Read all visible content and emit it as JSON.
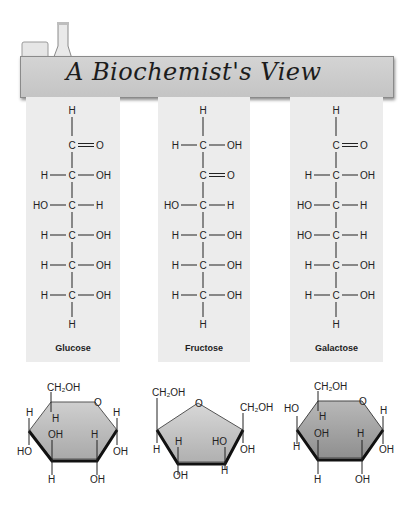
{
  "header": {
    "title": "A Biochemist's View",
    "icon": "lab-glassware-icon"
  },
  "fischer": [
    {
      "name": "Glucose",
      "top": "H",
      "rows": [
        {
          "left": "",
          "center": "C",
          "right": "O",
          "double": true
        },
        {
          "left": "H",
          "center": "C",
          "right": "OH"
        },
        {
          "left": "HO",
          "center": "C",
          "right": "H"
        },
        {
          "left": "H",
          "center": "C",
          "right": "OH"
        },
        {
          "left": "H",
          "center": "C",
          "right": "OH"
        },
        {
          "left": "H",
          "center": "C",
          "right": "OH"
        }
      ],
      "bottom": "H"
    },
    {
      "name": "Fructose",
      "top": "H",
      "rows": [
        {
          "left": "H",
          "center": "C",
          "right": "OH"
        },
        {
          "left": "",
          "center": "C",
          "right": "O",
          "double": true
        },
        {
          "left": "HO",
          "center": "C",
          "right": "H"
        },
        {
          "left": "H",
          "center": "C",
          "right": "OH"
        },
        {
          "left": "H",
          "center": "C",
          "right": "OH"
        },
        {
          "left": "H",
          "center": "C",
          "right": "OH"
        }
      ],
      "bottom": "H"
    },
    {
      "name": "Galactose",
      "top": "H",
      "rows": [
        {
          "left": "",
          "center": "C",
          "right": "O",
          "double": true
        },
        {
          "left": "H",
          "center": "C",
          "right": "OH"
        },
        {
          "left": "HO",
          "center": "C",
          "right": "H"
        },
        {
          "left": "HO",
          "center": "C",
          "right": "H"
        },
        {
          "left": "H",
          "center": "C",
          "right": "OH"
        },
        {
          "left": "H",
          "center": "C",
          "right": "OH"
        }
      ],
      "bottom": "H"
    }
  ],
  "rings": {
    "glucose": {
      "ring_o": "O",
      "labels": {
        "ch2oh": "CH₂OH",
        "c5_h": "H",
        "c4_h": "H",
        "c4_oh": "HO",
        "c3_oh": "OH",
        "c3_h": "H",
        "c2_h": "H",
        "c2_oh": "OH",
        "c1_h": "H",
        "c1_oh": "OH"
      },
      "fill": "#b9b9b9"
    },
    "fructose": {
      "ring_o": "O",
      "labels": {
        "c6": "CH₂OH",
        "c1": "CH₂OH",
        "c5_h": "H",
        "c4_h": "H",
        "c4_oh": "OH",
        "c3_oh": "HO",
        "c3_h": "H",
        "c2_oh": "OH"
      },
      "fill": "#c4c4c4"
    },
    "galactose": {
      "ring_o": "O",
      "labels": {
        "ch2oh": "CH₂OH",
        "c5_h": "H",
        "c4_oh": "HO",
        "c4_h": "H",
        "c3_oh": "OH",
        "c3_h": "H",
        "c2_h": "H",
        "c2_oh": "OH",
        "c1_h": "H",
        "c1_oh": "OH"
      },
      "fill": "#a8a8a8"
    }
  },
  "colors": {
    "panel_bg": "#ececec",
    "banner_bg": "#cdcdcd",
    "text": "#222222"
  }
}
